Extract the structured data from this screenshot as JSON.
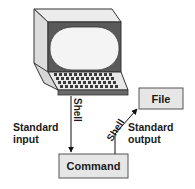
{
  "diagram": {
    "terminal": {
      "label": ""
    },
    "command_box": {
      "label": "Command"
    },
    "file_box": {
      "label": "File"
    },
    "input_arrow": {
      "label": "Shell"
    },
    "output_arrow": {
      "label": "Shell"
    },
    "standard_input": {
      "line1": "Standard",
      "line2": "input"
    },
    "standard_output": {
      "line1": "Standard",
      "line2": "output"
    }
  },
  "colors": {
    "box_fill": "#e6e6e6",
    "box_stroke": "#555555",
    "monitor_dark": "#5a5a5a",
    "monitor_light": "#e8e8e8",
    "screen": "#f4f4f4",
    "keys": "#3a3a3a"
  }
}
